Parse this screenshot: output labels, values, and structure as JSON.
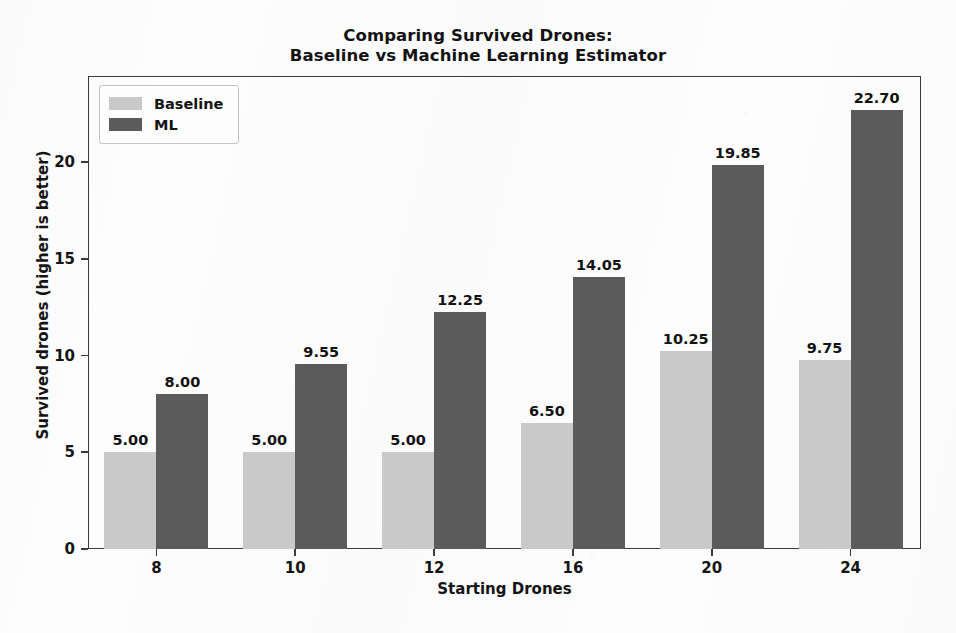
{
  "chart_data": {
    "type": "bar",
    "title": "Comparing Survived Drones:\nBaseline vs Machine Learning Estimator",
    "title_lines": [
      "Comparing Survived Drones:",
      "Baseline vs Machine Learning Estimator"
    ],
    "xlabel": "Starting Drones",
    "ylabel": "Survived drones (higher is better)",
    "categories": [
      "8",
      "10",
      "12",
      "16",
      "20",
      "24"
    ],
    "series": [
      {
        "name": "Baseline",
        "color": "#c9c9c9",
        "values": [
          5.0,
          5.0,
          5.0,
          6.5,
          10.25,
          9.75
        ],
        "labels": [
          "5.00",
          "5.00",
          "5.00",
          "6.50",
          "10.25",
          "9.75"
        ]
      },
      {
        "name": "ML",
        "color": "#5b5b5b",
        "values": [
          8.0,
          9.55,
          12.25,
          14.05,
          19.85,
          22.7
        ],
        "labels": [
          "8.00",
          "9.55",
          "12.25",
          "14.05",
          "19.85",
          "22.70"
        ]
      }
    ],
    "ylim": [
      0,
      24.45
    ],
    "yticks": [
      0,
      5,
      10,
      15,
      20
    ],
    "ytick_labels": [
      "0",
      "5",
      "10",
      "15",
      "20"
    ],
    "grid": false,
    "legend_position": "upper left",
    "legend_entries": [
      "Baseline",
      "ML"
    ],
    "bar_value_labels": true
  },
  "legend": {
    "items": [
      {
        "label": "Baseline",
        "swatch": "baseline-swatch"
      },
      {
        "label": "ML",
        "swatch": "ml-swatch"
      }
    ]
  },
  "colors": {
    "baseline": "#c9c9c9",
    "ml": "#5b5b5b",
    "axis": "#3a3a42",
    "text": "#141414",
    "background": "#fdfdfd"
  }
}
